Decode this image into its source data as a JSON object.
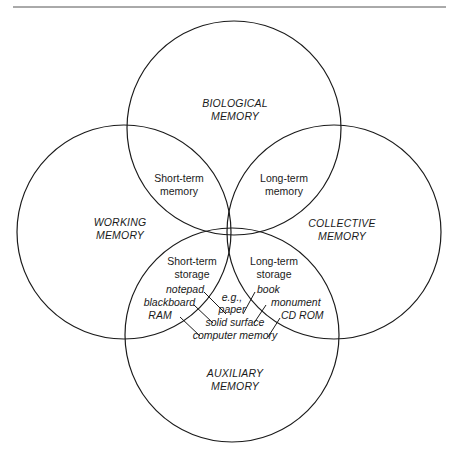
{
  "diagram": {
    "type": "venn",
    "circles": [
      {
        "id": "biological",
        "label_line1": "BIOLOGICAL",
        "label_line2": "MEMORY",
        "cx": 234,
        "cy": 128,
        "r": 107
      },
      {
        "id": "working",
        "label_line1": "WORKING",
        "label_line2": "MEMORY",
        "cx": 124,
        "cy": 232,
        "r": 107
      },
      {
        "id": "collective",
        "label_line1": "COLLECTIVE",
        "label_line2": "MEMORY",
        "cx": 334,
        "cy": 232,
        "r": 107
      },
      {
        "id": "auxiliary",
        "label_line1": "AUXILIARY",
        "label_line2": "MEMORY",
        "cx": 232,
        "cy": 335,
        "r": 107
      }
    ],
    "intersections": {
      "short_term_memory": {
        "line1": "Short-term",
        "line2": "memory"
      },
      "long_term_memory": {
        "line1": "Long-term",
        "line2": "memory"
      },
      "short_term_storage": {
        "line1": "Short-term",
        "line2": "storage"
      },
      "long_term_storage": {
        "line1": "Long-term",
        "line2": "storage"
      }
    },
    "examples": {
      "left": [
        "notepad",
        "blackboard",
        "RAM"
      ],
      "right": [
        "book",
        "monument",
        "CD ROM"
      ],
      "shared": [
        "e.g.,",
        "paper",
        "solid surface",
        "computer memory"
      ]
    },
    "colors": {
      "stroke": "#1a1a1a",
      "background": "#ffffff",
      "rule": "#555555"
    }
  }
}
